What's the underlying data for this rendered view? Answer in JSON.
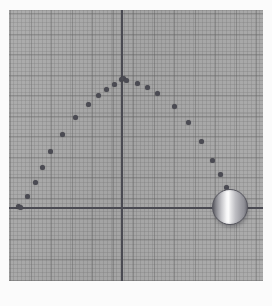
{
  "plot": {
    "background_color": "#a9a9a9",
    "grid": {
      "enabled": true,
      "minor_spacing_px": 4,
      "major_spacing_px": 20,
      "minor_color": "#787878",
      "major_color": "#5f5f5f"
    },
    "axis_color": "#4a4a52",
    "marker_color": "#4b4b53",
    "origin": {
      "x": 112,
      "y": 197
    },
    "axis_label": "0 Unit"
  },
  "sphere": {
    "label": "projectile-ball",
    "center": {
      "x": 221,
      "y": 197
    },
    "radius": 18,
    "highlight_color": "#fdfdfd",
    "shade_color": "#5d5d64",
    "rim_color": "#5a5a62"
  },
  "chart_data": {
    "type": "scatter",
    "title": "",
    "subtitle": "",
    "xlabel": "0 Unit",
    "ylabel": "",
    "grid": true,
    "legend": null,
    "axis_origin_px": {
      "x": 112,
      "y": 197
    },
    "xlim_px": [
      0,
      254
    ],
    "ylim_px": [
      0,
      271
    ],
    "series": [
      {
        "name": "trajectory",
        "marker_color": "#4b4b53",
        "points_px": [
          [
            9,
            196
          ],
          [
            11,
            197
          ],
          [
            18,
            186
          ],
          [
            26,
            172
          ],
          [
            33,
            157
          ],
          [
            41,
            141
          ],
          [
            53,
            124
          ],
          [
            66,
            107
          ],
          [
            79,
            94
          ],
          [
            89,
            85
          ],
          [
            97,
            79
          ],
          [
            105,
            74
          ],
          [
            112,
            69
          ],
          [
            114,
            68
          ],
          [
            117,
            70
          ],
          [
            128,
            73
          ],
          [
            138,
            77
          ],
          [
            148,
            83
          ],
          [
            165,
            96
          ],
          [
            179,
            112
          ],
          [
            192,
            131
          ],
          [
            203,
            150
          ],
          [
            211,
            164
          ],
          [
            217,
            177
          ]
        ]
      }
    ]
  }
}
